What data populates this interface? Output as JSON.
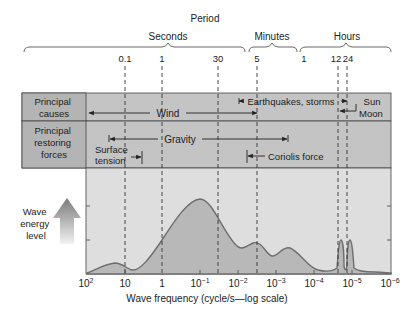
{
  "title": "Period",
  "period_groups": [
    {
      "label": "Seconds",
      "x1": 22,
      "x2": 245,
      "labelx": 170
    },
    {
      "label": "Minutes",
      "x1": 248,
      "x2": 298,
      "labelx": 270
    },
    {
      "label": "Hours",
      "x1": 300,
      "x2": 392,
      "labelx": 345
    }
  ],
  "period_ticks": [
    {
      "label": "0.1",
      "x": 125
    },
    {
      "label": "1",
      "x": 162
    },
    {
      "label": "30",
      "x": 218
    },
    {
      "label": "5",
      "x": 257
    },
    {
      "label": "1",
      "x": 304
    },
    {
      "label": "12",
      "x": 337
    },
    {
      "label": "24",
      "x": 346
    }
  ],
  "rows": {
    "causes": {
      "label_line1": "Principal",
      "label_line2": "causes"
    },
    "restoring": {
      "label_line1": "Principal",
      "label_line2": "restoring",
      "label_line3": "forces"
    }
  },
  "causes": {
    "wind": "Wind",
    "earthquakes": "Earthquakes, storms",
    "sun": "Sun",
    "moon": "Moon"
  },
  "forces": {
    "gravity": "Gravity",
    "surface_line1": "Surface",
    "surface_line2": "tension",
    "coriolis": "Coriolis force"
  },
  "y_axis": {
    "line1": "Wave",
    "line2": "energy",
    "line3": "level"
  },
  "x_axis": {
    "title": "Wave frequency (cycle/s—log scale)",
    "ticks": [
      {
        "base": "10",
        "exp": "2",
        "x": 87
      },
      {
        "base": "10",
        "exp": "",
        "x": 125
      },
      {
        "base": "1",
        "exp": "",
        "x": 162
      },
      {
        "base": "10",
        "exp": "−1",
        "x": 200
      },
      {
        "base": "10",
        "exp": "−2",
        "x": 238
      },
      {
        "base": "10",
        "exp": "−3",
        "x": 276
      },
      {
        "base": "10",
        "exp": "−4",
        "x": 314
      },
      {
        "base": "10",
        "exp": "−5",
        "x": 352
      },
      {
        "base": "10",
        "exp": "−6",
        "x": 390
      }
    ]
  },
  "colors": {
    "label_cell": "#b4b4b4",
    "row_bg": "#c4c4c4",
    "chart_bg": "#dedede",
    "curve_fill": "#b8b8b8",
    "curve_line": "#6e6e6e",
    "border": "#444444"
  }
}
